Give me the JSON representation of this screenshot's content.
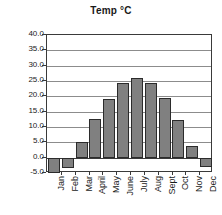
{
  "chart_data": {
    "type": "bar",
    "title": "Temp °C",
    "xlabel": "",
    "ylabel": "",
    "categories": [
      "Jan",
      "Feb",
      "Mar",
      "April",
      "May",
      "June",
      "July",
      "Aug",
      "Sept",
      "Oct",
      "Nov",
      "Dec"
    ],
    "values": [
      -5.0,
      -3.5,
      5.0,
      12.7,
      19.0,
      24.5,
      26.0,
      24.5,
      19.3,
      12.2,
      3.7,
      -3.2
    ],
    "ylim": [
      -5.0,
      40.0
    ],
    "ytick_step": 5.0,
    "ytick_labels": [
      "40.0",
      "35.0",
      "30.0",
      "25.0",
      "20.0",
      "15.0",
      "10.0",
      "5.0",
      "0.0",
      "-5.0"
    ],
    "ytick_values": [
      40.0,
      35.0,
      30.0,
      25.0,
      20.0,
      15.0,
      10.0,
      5.0,
      0.0,
      -5.0
    ],
    "grid": true,
    "legend": null,
    "series_color": "#808080",
    "bar_border_color": "#2b2b2b",
    "grid_color": "#8c8c8c",
    "axis_color": "#3a3a3a"
  }
}
